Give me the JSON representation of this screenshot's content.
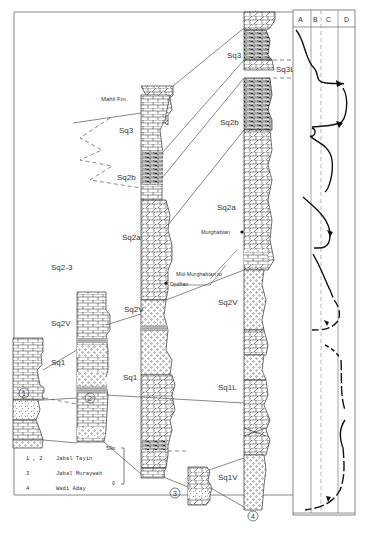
{
  "figure": {
    "type": "stratigraphic-correlation-diagram",
    "columns": [
      {
        "id": "1",
        "label": "1"
      },
      {
        "id": "2",
        "label": "2"
      },
      {
        "id": "3",
        "label": "3"
      },
      {
        "id": "4",
        "label": "4"
      }
    ],
    "sequence_labels": {
      "mahil": "Mahil Fm.",
      "sq3_a": "Sq3",
      "sq2b_a": "Sq2b",
      "sq2a_a": "Sq2a",
      "sq23": "Sq2-3",
      "sq2v_1": "Sq2V",
      "sq2v_3": "Sq2V",
      "sq1_1": "Sq1",
      "sq1_3": "Sq1",
      "sq3_4": "Sq3",
      "sq3L": "Sq3L",
      "sq2b_4": "Sq2b",
      "sq2a_4": "Sq2a",
      "sq2v_4": "Sq2V",
      "sq1L": "Sq1L",
      "sq1v": "Sq1V"
    },
    "annotations": {
      "murghabian": "Murghabian",
      "mid_murghabian_1": "Mid-Murghabian to",
      "mid_murghabian_2": "Djulfian"
    },
    "scale_bar": {
      "top": "50m",
      "bottom": "0"
    },
    "legend": [
      {
        "key": "1 , 2",
        "name": "Jabal Tayin"
      },
      {
        "key": "3",
        "name": "Jabal Muraywah"
      },
      {
        "key": "4",
        "name": "Wadi Aday"
      }
    ],
    "curve_panel": {
      "headers": [
        "A",
        "B",
        "C",
        "D"
      ]
    }
  }
}
